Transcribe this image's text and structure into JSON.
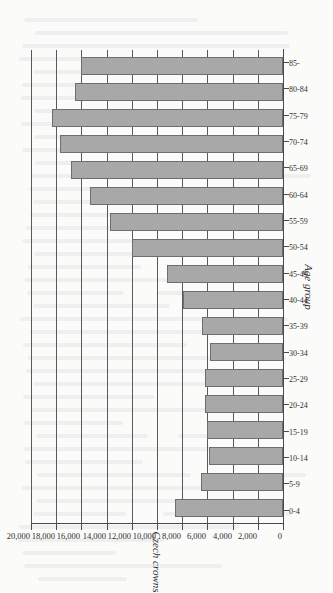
{
  "chart_data": {
    "type": "bar",
    "title": "",
    "subtitle": "",
    "orientation": "horizontal-on-page",
    "xlabel": "Age group",
    "ylabel": "Czech crowns",
    "ylim": [
      0,
      20000
    ],
    "ytick_step": 2000,
    "grid": true,
    "legend": null,
    "bar_color": "#a8a8a8",
    "bar_edge_color": "#6e6e6e",
    "axis_color": "#4a4a4a",
    "categories": [
      "0-4",
      "5-9",
      "10-14",
      "15-19",
      "20-24",
      "25-29",
      "30-34",
      "35-39",
      "40-44",
      "45-49",
      "50-54",
      "55-59",
      "60-64",
      "65-69",
      "70-74",
      "75-79",
      "80-84",
      "85-"
    ],
    "values": [
      8600,
      6500,
      5900,
      6000,
      6200,
      6200,
      5800,
      6400,
      7900,
      9200,
      12000,
      13700,
      15300,
      16800,
      17700,
      18300,
      16500,
      16000
    ],
    "ytick_labels": [
      "0",
      "2,000",
      "4,000",
      "6,000",
      "8,000",
      "10,000",
      "12,000",
      "14,000",
      "16,000",
      "18,000",
      "20,000"
    ],
    "ytick_values": [
      0,
      2000,
      4000,
      6000,
      8000,
      10000,
      12000,
      14000,
      16000,
      18000,
      20000
    ]
  }
}
